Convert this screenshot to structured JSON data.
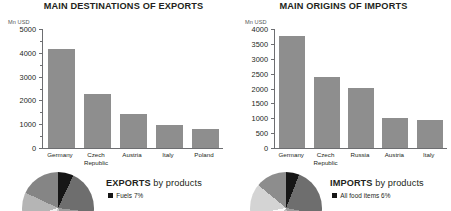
{
  "exports_panel": {
    "title": "MAIN DESTINATIONS OF EXPORTS",
    "axis_unit": "Mn USD",
    "pie_heading_strong": "EXPORTS",
    "pie_heading_weak": "by products",
    "legend": [
      {
        "label": "Fuels 7%",
        "color": "#161616"
      }
    ]
  },
  "imports_panel": {
    "title": "MAIN ORIGINS OF IMPORTS",
    "axis_unit": "Mn USD",
    "pie_heading_strong": "IMPORTS",
    "pie_heading_weak": "by products",
    "legend": [
      {
        "label": "All food items 6%",
        "color": "#161616"
      }
    ]
  },
  "colors": {
    "bar": "#8e8e8e",
    "axis": "#6d6e71",
    "text": "#231f20",
    "unit_text": "#58585b"
  },
  "chart_data": [
    {
      "type": "bar",
      "title": "MAIN DESTINATIONS OF EXPORTS",
      "xlabel": "",
      "ylabel": "Mn USD",
      "ylim": [
        0,
        5000
      ],
      "yticks": [
        0,
        1000,
        2000,
        3000,
        4000,
        5000
      ],
      "ytick_labels": [
        "0",
        "1000",
        "2000",
        "3000",
        "4000",
        "5000"
      ],
      "yminor_ticks": [
        500,
        1500,
        2500,
        3500,
        4500
      ],
      "grid": false,
      "legend": "none",
      "categories": [
        "Germany",
        "Czech\nRepublic",
        "Austria",
        "Italy",
        "Poland"
      ],
      "values": [
        4150,
        2250,
        1430,
        980,
        780
      ],
      "bar_color": "#8e8e8e"
    },
    {
      "type": "bar",
      "title": "MAIN ORIGINS OF IMPORTS",
      "xlabel": "",
      "ylabel": "Mn USD",
      "ylim": [
        0,
        4000
      ],
      "yticks": [
        0,
        500,
        1000,
        1500,
        2000,
        2500,
        3000,
        3500,
        4000
      ],
      "ytick_labels": [
        "0",
        "500",
        "1000",
        "1500",
        "2000",
        "2500",
        "3000",
        "3500",
        "4000"
      ],
      "yminor_ticks": [],
      "grid": false,
      "legend": "none",
      "categories": [
        "Germany",
        "Czech\nRepublic",
        "Russia",
        "Austria",
        "Italy"
      ],
      "values": [
        3750,
        2400,
        2020,
        1020,
        930
      ],
      "bar_color": "#8e8e8e"
    },
    {
      "type": "pie",
      "title": "EXPORTS by products",
      "legend_position": "right",
      "labels": [
        "Fuels 7%"
      ],
      "values": [
        7
      ],
      "colors": [
        "#161616"
      ],
      "note": "pie is clipped by the bottom edge of the screenshot"
    },
    {
      "type": "pie",
      "title": "IMPORTS by products",
      "legend_position": "right",
      "labels": [
        "All food items 6%"
      ],
      "values": [
        6
      ],
      "colors": [
        "#161616"
      ],
      "note": "pie is clipped by the bottom edge of the screenshot"
    }
  ]
}
